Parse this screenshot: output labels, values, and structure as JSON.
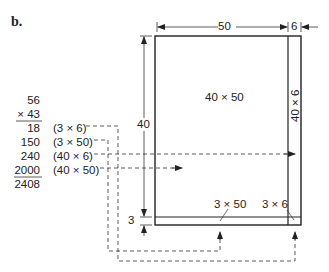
{
  "label": "b.",
  "multiplication": {
    "multiplicand": "56",
    "multiplier": "× 43",
    "partial_products": [
      {
        "value": "18",
        "expr": "(3 × 6)"
      },
      {
        "value": "150",
        "expr": "(3 × 50)"
      },
      {
        "value": "240",
        "expr": "(40 × 6)"
      },
      {
        "value": "2000",
        "expr": "(40 × 50)"
      }
    ],
    "total": "2408"
  },
  "rectangle": {
    "width_top": "50",
    "width_right": "6",
    "height_main": "40",
    "height_bottom": "3",
    "regions": {
      "main": "40 × 50",
      "right": "40 × 6",
      "bottom": "3 × 50",
      "corner": "3 × 6"
    }
  }
}
